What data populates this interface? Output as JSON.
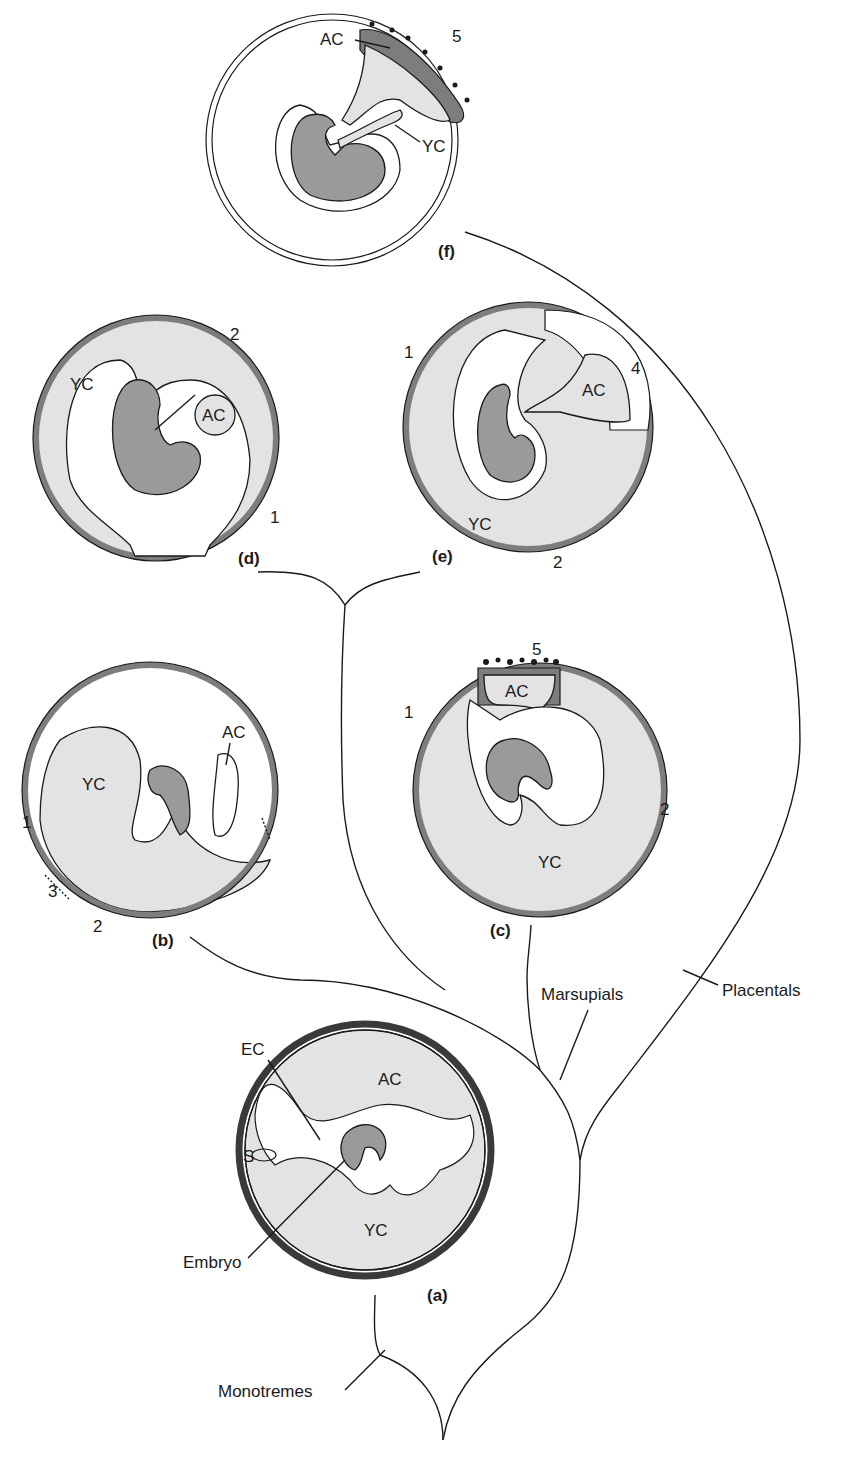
{
  "figure": {
    "type": "evolutionary tree of mammalian extraembryonic membranes",
    "colors": {
      "cavity_fill": "#e3e3e3",
      "embryo_fill": "#9a9a9a",
      "trophoblast": "#7d7d7d",
      "line": "#1a1a1a"
    }
  },
  "panels": {
    "a": {
      "caption": "(a)",
      "labels": {
        "ac": "AC",
        "yc": "YC",
        "ec": "EC",
        "s": "S",
        "embryo": "Embryo"
      }
    },
    "b": {
      "caption": "(b)",
      "labels": {
        "ac": "AC",
        "yc": "YC",
        "n1": "1",
        "n2": "2",
        "n3": "3"
      }
    },
    "c": {
      "caption": "(c)",
      "labels": {
        "ac": "AC",
        "yc": "YC",
        "n1": "1",
        "n2": "2",
        "n5": "5"
      }
    },
    "d": {
      "caption": "(d)",
      "labels": {
        "ac": "AC",
        "yc": "YC",
        "n1": "1",
        "n2": "2"
      }
    },
    "e": {
      "caption": "(e)",
      "labels": {
        "ac": "AC",
        "yc": "YC",
        "n1": "1",
        "n2": "2",
        "n4": "4"
      }
    },
    "f": {
      "caption": "(f)",
      "labels": {
        "ac": "AC",
        "yc": "YC",
        "n5": "5"
      }
    }
  },
  "tree": {
    "clades": {
      "monotremes": "Monotremes",
      "marsupials": "Marsupials",
      "placentals": "Placentals"
    }
  }
}
